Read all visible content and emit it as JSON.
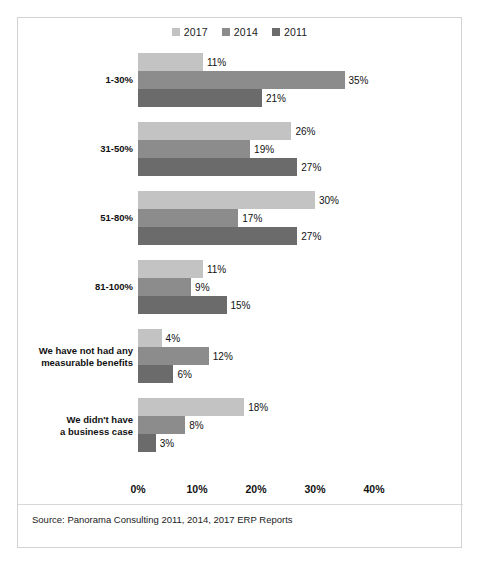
{
  "chart_data": {
    "type": "bar",
    "orientation": "horizontal",
    "title": "",
    "xlabel": "",
    "ylabel": "",
    "xlim": [
      0,
      40
    ],
    "xticks": [
      "0%",
      "10%",
      "20%",
      "30%",
      "40%"
    ],
    "xtick_values": [
      0,
      10,
      20,
      30,
      40
    ],
    "grid": false,
    "legend_position": "top-center",
    "categories": [
      "1-30%",
      "31-50%",
      "51-80%",
      "81-100%",
      "We have not had any\nmeasurable benefits",
      "We didn't have\na business case"
    ],
    "category_lines": [
      [
        "1-30%"
      ],
      [
        "31-50%"
      ],
      [
        "51-80%"
      ],
      [
        "81-100%"
      ],
      [
        "We have not had any",
        "measurable benefits"
      ],
      [
        "We didn't have",
        "a business case"
      ]
    ],
    "series": [
      {
        "name": "2017",
        "color": "#c3c3c3",
        "values": [
          11,
          26,
          30,
          11,
          4,
          18
        ],
        "labels": [
          "11%",
          "26%",
          "30%",
          "11%",
          "4%",
          "18%"
        ]
      },
      {
        "name": "2014",
        "color": "#8c8c8c",
        "values": [
          35,
          19,
          17,
          9,
          12,
          8
        ],
        "labels": [
          "35%",
          "19%",
          "17%",
          "9%",
          "12%",
          "8%"
        ]
      },
      {
        "name": "2011",
        "color": "#6b6b6b",
        "values": [
          21,
          27,
          27,
          15,
          6,
          3
        ],
        "labels": [
          "21%",
          "27%",
          "27%",
          "15%",
          "6%",
          "3%"
        ]
      }
    ],
    "source": "Source: Panorama Consulting 2011, 2014, 2017 ERP Reports"
  }
}
